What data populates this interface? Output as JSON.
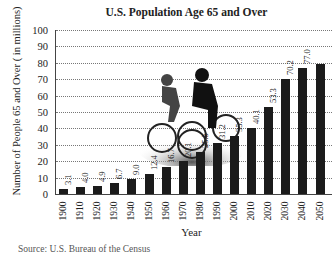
{
  "chart_data": {
    "type": "bar",
    "title": "U.S. Population Age 65 and Over",
    "xlabel": "Year",
    "ylabel": "Number of People 65 and Over ( in millions)",
    "ylim": [
      0,
      100
    ],
    "yticks": [
      0,
      10,
      20,
      30,
      40,
      50,
      60,
      70,
      80,
      90,
      100
    ],
    "grid": true,
    "categories": [
      "1900",
      "1910",
      "1920",
      "1930",
      "1940",
      "1950",
      "1960",
      "1970",
      "1980",
      "1990",
      "2000",
      "2010",
      "2020",
      "2030",
      "2040",
      "2050"
    ],
    "values": [
      3.1,
      4.0,
      4.9,
      6.7,
      9.0,
      12.4,
      16.7,
      20.1,
      25.5,
      31.2,
      35.3,
      40.1,
      53.3,
      70.2,
      77.0,
      79.0
    ],
    "labels": [
      "3.1",
      "4.0",
      "4.9",
      "6.7",
      "9.0",
      "12.4",
      "16.7",
      "20.1",
      "25.5",
      "31.2",
      "35.3",
      "40.1",
      "53.3",
      "70.2",
      "77.0",
      ""
    ],
    "annotations": [
      "Photo of two cyclists riding bicycles"
    ],
    "source": "Source: U.S. Bureau of the Census"
  },
  "colors": {
    "bar": "#1b1b1b",
    "grid": "#777777"
  }
}
